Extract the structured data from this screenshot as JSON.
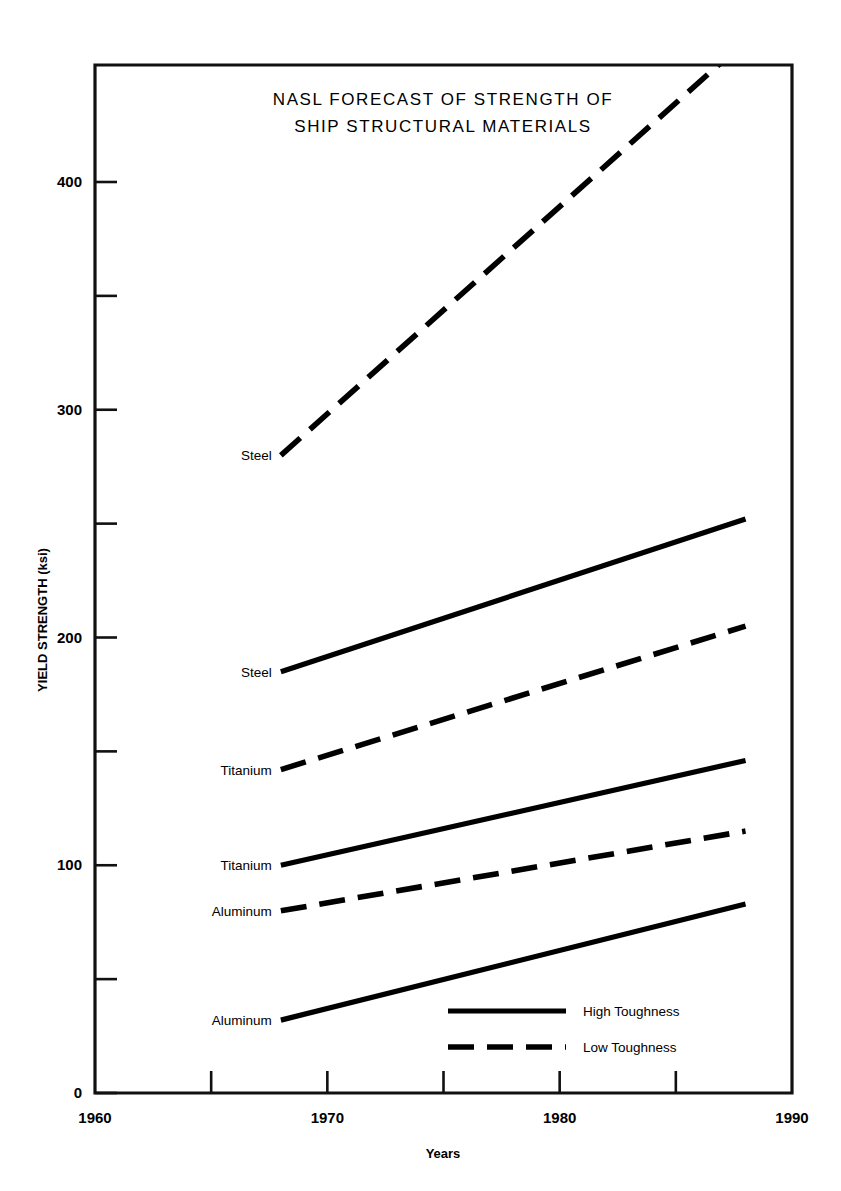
{
  "chart_data": {
    "type": "line",
    "title": "NASL FORECAST OF STRENGTH OF SHIP STRUCTURAL MATERIALS",
    "title_line1": "NASL FORECAST OF STRENGTH OF",
    "title_line2": "SHIP STRUCTURAL MATERIALS",
    "xlabel": "Years",
    "ylabel": "YIELD STRENGTH (ksi)",
    "xlim": [
      1960,
      1990
    ],
    "ylim": [
      0,
      460
    ],
    "grid": false,
    "legend_position": "bottom-center",
    "x_ticks_major": [
      "1960",
      "1970",
      "1980",
      "1990"
    ],
    "x_ticks_major_values": [
      1960,
      1970,
      1980,
      1990
    ],
    "x_ticks_minor_values": [
      1965,
      1975,
      1985
    ],
    "y_ticks_major": [
      "0",
      "100",
      "200",
      "300",
      "400"
    ],
    "y_ticks_major_values": [
      0,
      100,
      200,
      300,
      400
    ],
    "y_ticks_minor_values": [
      50,
      150,
      250,
      350
    ],
    "legend": [
      {
        "label": "High Toughness",
        "style": "solid"
      },
      {
        "label": "Low Toughness",
        "style": "dashed"
      }
    ],
    "series": [
      {
        "name": "Steel",
        "label": "Steel",
        "toughness": "Low Toughness",
        "style": "dashed",
        "x": [
          1968,
          1988
        ],
        "values": [
          280,
          462
        ],
        "label_anchor_year": 1968,
        "label_anchor_value": 280
      },
      {
        "name": "Steel",
        "label": "Steel",
        "toughness": "High Toughness",
        "style": "solid",
        "x": [
          1968,
          1988
        ],
        "values": [
          185,
          252
        ],
        "label_anchor_year": 1968,
        "label_anchor_value": 185
      },
      {
        "name": "Titanium",
        "label": "Titanium",
        "toughness": "Low Toughness",
        "style": "dashed",
        "x": [
          1968,
          1988
        ],
        "values": [
          142,
          205
        ],
        "label_anchor_year": 1968,
        "label_anchor_value": 142
      },
      {
        "name": "Titanium",
        "label": "Titanium",
        "toughness": "High Toughness",
        "style": "solid",
        "x": [
          1968,
          1988
        ],
        "values": [
          100,
          146
        ],
        "label_anchor_year": 1968,
        "label_anchor_value": 100
      },
      {
        "name": "Aluminum",
        "label": "Aluminum",
        "toughness": "Low Toughness",
        "style": "dashed",
        "x": [
          1968,
          1988
        ],
        "values": [
          80,
          115
        ],
        "label_anchor_year": 1968,
        "label_anchor_value": 80
      },
      {
        "name": "Aluminum",
        "label": "Aluminum",
        "toughness": "High Toughness",
        "style": "solid",
        "x": [
          1968,
          1988
        ],
        "values": [
          32,
          83
        ],
        "label_anchor_year": 1968,
        "label_anchor_value": 32
      }
    ],
    "colors": {
      "line": "#000000",
      "axis": "#111111",
      "background": "#ffffff",
      "text": "#000000"
    }
  }
}
